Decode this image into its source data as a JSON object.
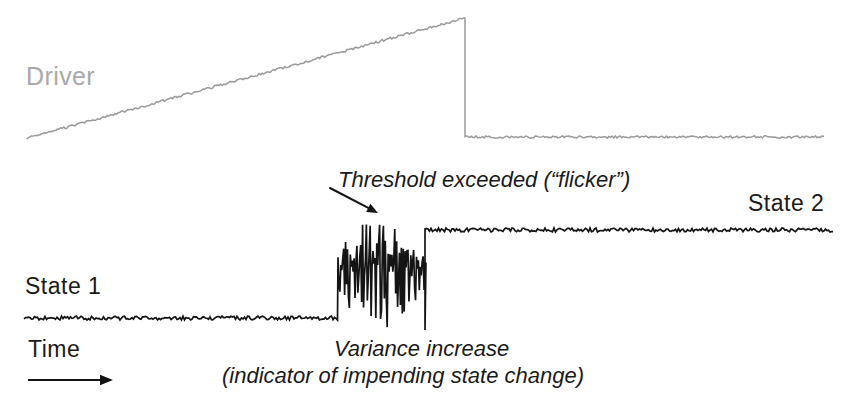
{
  "figure": {
    "background_color": "#ffffff",
    "width": 845,
    "height": 418
  },
  "labels": {
    "driver": "Driver",
    "state1": "State 1",
    "state2": "State 2",
    "time": "Time"
  },
  "annotations": {
    "threshold": "Threshold exceeded (“flicker”)",
    "variance": "Variance increase",
    "indicator": "(indicator of impending state change)"
  },
  "colors": {
    "driver_trace": "#9a9a9a",
    "driver_label": "#a9a9a9",
    "state_trace": "#141414",
    "text": "#1a1a1a",
    "arrow": "#141414"
  },
  "icons": {
    "threshold_pointer": "arrow-down-right-icon",
    "time_axis": "arrow-right-icon"
  },
  "chart_data": {
    "type": "line",
    "xlabel": "Time",
    "ylabel": "",
    "grid": false,
    "legend": "none",
    "xlim": [
      0,
      845
    ],
    "ylim_pixels_inverted": [
      0,
      418
    ],
    "series": [
      {
        "name": "Driver",
        "color": "#9a9a9a",
        "description": "Slow sawtooth forcing: noisy linear ramp rising left-to-right, then an abrupt vertical drop back to a low noisy plateau.",
        "noise_amplitude": 1.2,
        "segments": [
          {
            "kind": "ramp",
            "x_start": 27,
            "x_end": 465,
            "y_start": 138,
            "y_end": 18
          },
          {
            "kind": "drop",
            "x": 465,
            "y_from": 18,
            "y_to": 137
          },
          {
            "kind": "plateau",
            "x_start": 465,
            "x_end": 824,
            "y": 137
          }
        ]
      },
      {
        "name": "System state",
        "color": "#141414",
        "description": "Bistable system output: flat low State 1 baseline, a burst of high-variance flickering between the two attractors, then a flat high State 2 baseline.",
        "noise_amplitude": 2.0,
        "segments": [
          {
            "kind": "plateau",
            "label": "State 1",
            "x_start": 24,
            "x_end": 338,
            "y": 318
          },
          {
            "kind": "flicker",
            "label": "Variance increase / flicker",
            "x_start": 338,
            "x_end": 425,
            "y_low": 330,
            "y_high": 215,
            "spike_count": 46
          },
          {
            "kind": "plateau",
            "label": "State 2",
            "x_start": 425,
            "x_end": 833,
            "y": 230
          }
        ]
      }
    ],
    "annotations": [
      {
        "text": "Threshold exceeded (“flicker”)",
        "text_x": 338,
        "text_y": 180,
        "arrow_from": [
          330,
          188
        ],
        "arrow_to": [
          378,
          213
        ]
      },
      {
        "text": "Variance increase",
        "text_x": 334,
        "text_y": 348
      },
      {
        "text": "(indicator of impending state change)",
        "text_x": 222,
        "text_y": 375
      },
      {
        "text": "Time",
        "text_x": 28,
        "text_y": 348,
        "arrow_from": [
          28,
          380
        ],
        "arrow_to": [
          113,
          380
        ]
      },
      {
        "text": "State 1",
        "text_x": 25,
        "text_y": 285
      },
      {
        "text": "State 2",
        "text_x": 748,
        "text_y": 202
      },
      {
        "text": "Driver",
        "text_x": 26,
        "text_y": 75
      }
    ]
  }
}
